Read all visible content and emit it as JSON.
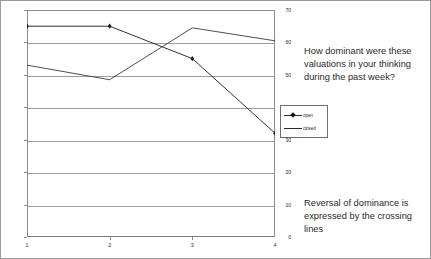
{
  "chart_data": {
    "type": "line",
    "title": "",
    "xlabel": "",
    "ylabel": "",
    "categories": [
      "1",
      "2",
      "3",
      "4"
    ],
    "x_tick_labels": [
      "1",
      "2",
      "3",
      "4"
    ],
    "y_tick_labels": [
      "70",
      "60",
      "50",
      "40",
      "30",
      "20",
      "10",
      "0"
    ],
    "ylim": [
      0,
      70
    ],
    "y_tick_step": 10,
    "grid": "horizontal",
    "legend_position": "right-middle",
    "series": [
      {
        "name": "open",
        "marker": "diamond",
        "color": "#1a1a1a",
        "values": [
          65,
          65,
          55,
          32
        ]
      },
      {
        "name": "closed",
        "marker": "none",
        "color": "#3a3a3a",
        "values": [
          53,
          48.5,
          64.5,
          60.5
        ]
      }
    ]
  },
  "legend": {
    "items": [
      {
        "label": "open"
      },
      {
        "label": "closed"
      }
    ]
  },
  "annotations": {
    "question": "How dominant were these valuations in your thinking during the past week?",
    "note": "Reversal of dominance is expressed by the crossing lines"
  },
  "colors": {
    "background": "#ffffff",
    "frame": "#9a9a9a",
    "axis": "#8c8c8c",
    "gridline": "#9d9d9d",
    "series_open": "#1a1a1a",
    "series_closed": "#3a3a3a",
    "text": "#2a2a2a"
  }
}
